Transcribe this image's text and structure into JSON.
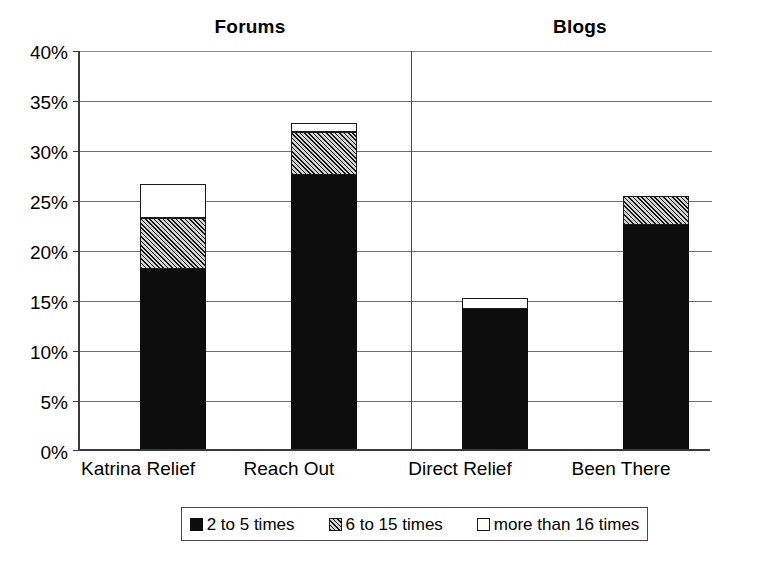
{
  "chart_data": {
    "type": "bar",
    "subtype": "stacked-bar",
    "title": "",
    "xlabel": "",
    "ylabel": "",
    "ylim": [
      0,
      40
    ],
    "y_unit": "%",
    "grid": true,
    "legend_position": "bottom",
    "categories": [
      "Katrina Relief",
      "Reach Out",
      "Direct Relief",
      "Been There"
    ],
    "groups": [
      {
        "label": "Forums",
        "categories": [
          "Katrina Relief",
          "Reach Out"
        ]
      },
      {
        "label": "Blogs",
        "categories": [
          "Direct Relief",
          "Been There"
        ]
      }
    ],
    "series": [
      {
        "name": "2 to 5 times",
        "fill": "black",
        "values": [
          18.0,
          27.4,
          14.0,
          22.4
        ]
      },
      {
        "name": "6 to 15 times",
        "fill": "hatched",
        "values": [
          5.1,
          4.3,
          0.0,
          2.9
        ]
      },
      {
        "name": "more than 16 times",
        "fill": "white",
        "values": [
          3.4,
          0.9,
          1.1,
          0.0
        ]
      }
    ],
    "totals": [
      26.5,
      32.6,
      15.1,
      25.3
    ],
    "yticks": [
      0,
      5,
      10,
      15,
      20,
      25,
      30,
      35,
      40
    ],
    "ytick_labels": [
      "0%",
      "5%",
      "10%",
      "15%",
      "20%",
      "25%",
      "30%",
      "35%",
      "40%"
    ]
  },
  "axis": {
    "ytick_labels": [
      "40%",
      "35%",
      "30%",
      "25%",
      "20%",
      "15%",
      "10%",
      "5%",
      "0%"
    ]
  },
  "group_titles": [
    "Forums",
    "Blogs"
  ],
  "category_labels": [
    "Katrina Relief",
    "Reach Out",
    "Direct Relief",
    "Been There"
  ],
  "legend": {
    "items": [
      {
        "label": "2 to 5 times",
        "swatch": "black-square-icon"
      },
      {
        "label": "6 to 15 times",
        "swatch": "hatched-square-icon"
      },
      {
        "label": "more than 16 times",
        "swatch": "white-square-icon"
      }
    ]
  },
  "colors": {
    "black": "#0d0d0d",
    "hatch_light": "#d2d2d2",
    "hatch_dark": "#151515",
    "white": "#ffffff",
    "axis": "#3a3a3a",
    "gridline": "#6e6e6e",
    "background": "#ffffff"
  }
}
